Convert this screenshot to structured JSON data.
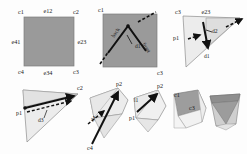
{
  "figure": {
    "background_color": "#fdfdfd",
    "fill_dark": "#9a9a9a",
    "fill_light": "#ededed",
    "fill_mid": "#d8d8d8",
    "stroke_color": "#555555",
    "arrow_color": "#111111"
  },
  "panels": [
    {
      "id": "panel-1",
      "name": "quad-with-corner-and-edge-labels",
      "labels": {
        "c1": "c1",
        "e12": "e12",
        "c2": "c2",
        "e41": "e41",
        "e23": "e23",
        "c4": "c4",
        "e34": "e34",
        "c3": "c3"
      }
    },
    {
      "id": "panel-2",
      "name": "quad-with-diagonal-split",
      "labels": {
        "c1": "c1",
        "c3": "c3",
        "d1": "d1",
        "back": "back",
        "front": "front"
      }
    },
    {
      "id": "panel-3",
      "name": "triangle-with-d1-d2",
      "labels": {
        "c3": "c3",
        "e23": "e23",
        "p1": "p1",
        "d2": "d2",
        "d1": "d1"
      }
    },
    {
      "id": "panel-4",
      "name": "triangle-with-d3",
      "labels": {
        "c2": "c2",
        "p1": "p1",
        "d3": "d3"
      }
    },
    {
      "id": "panel-5",
      "name": "polygon-with-d4",
      "labels": {
        "p2": "p2",
        "c4": "c4",
        "d4": "d4"
      }
    },
    {
      "id": "panel-6",
      "name": "polygon-with-l1",
      "labels": {
        "p2": "p2",
        "p1": "p1",
        "l1": "l1"
      }
    },
    {
      "id": "panel-7",
      "name": "shaded-quad-c1-c3",
      "labels": {
        "c1": "c1",
        "c3": "c3"
      }
    },
    {
      "id": "panel-8",
      "name": "final-solid-frustum",
      "labels": {}
    }
  ]
}
